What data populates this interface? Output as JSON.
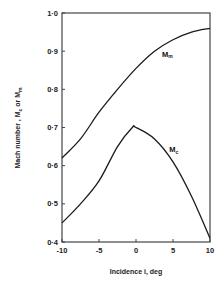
{
  "chart_data": {
    "type": "line",
    "title": "",
    "xlabel": "Incidence  i,   deg",
    "ylabel": "Mach number ,  Mc or Mm",
    "xlim": [
      -10,
      10
    ],
    "ylim": [
      0.4,
      1.0
    ],
    "grid": false,
    "legend_position": "inline",
    "x_ticks": [
      -10,
      -5,
      0,
      5,
      10
    ],
    "x_tick_labels": [
      "-10",
      "-5",
      "0",
      "5",
      "10"
    ],
    "y_ticks": [
      0.4,
      0.5,
      0.6,
      0.7,
      0.8,
      0.9,
      1.0
    ],
    "y_tick_labels": [
      "0·4",
      "0·5",
      "0·6",
      "0·7",
      "0·8",
      "0·9",
      "1·0"
    ],
    "series": [
      {
        "name": "Mm",
        "label_main": "M",
        "label_sub": "m",
        "x": [
          -10,
          -7.5,
          -5,
          -2.5,
          0,
          2.5,
          5,
          7.5,
          10
        ],
        "values": [
          0.62,
          0.67,
          0.74,
          0.8,
          0.855,
          0.9,
          0.93,
          0.95,
          0.96
        ]
      },
      {
        "name": "Mc",
        "label_main": "M",
        "label_sub": "c",
        "x": [
          -10,
          -7.5,
          -5,
          -2.5,
          -0.5,
          0,
          2.5,
          5,
          7.5,
          10
        ],
        "values": [
          0.45,
          0.5,
          0.56,
          0.65,
          0.7,
          0.7,
          0.67,
          0.61,
          0.52,
          0.41
        ]
      }
    ],
    "annotations": [
      {
        "text": "Mm",
        "x": 3.5,
        "y": 0.885
      },
      {
        "text": "Mc",
        "x": 4.5,
        "y": 0.635
      }
    ]
  },
  "labels": {
    "xlabel": "Incidence  i,   deg",
    "ylabel_main": "Mach number ,  M",
    "ylabel_sub1": "c",
    "ylabel_or": " or M",
    "ylabel_sub2": "m"
  }
}
